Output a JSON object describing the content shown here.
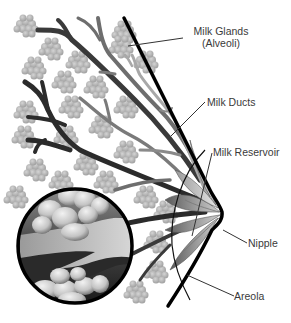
{
  "diagram": {
    "title": "",
    "labels": {
      "milk_glands": {
        "line1": "Milk Glands",
        "line2": "(Alveoli)"
      },
      "milk_ducts": "Milk Ducts",
      "milk_reservoir": "Milk Reservoir",
      "nipple": "Nipple",
      "areola": "Areola"
    },
    "colors": {
      "outline": "#000000",
      "leader_line": "#333333",
      "alveoli": "#b8b8b8",
      "alveoli_dark": "#9a9a9a",
      "duct_dark": "#2b2b2b",
      "duct_mid": "#6e6e6e",
      "duct_light": "#a8a8a8",
      "reservoir": "#8a8a8a",
      "label_text": "#3a3a3a"
    },
    "magnified_view": {
      "shape": "circle",
      "description": "cross-section of alveoli and duct"
    }
  }
}
